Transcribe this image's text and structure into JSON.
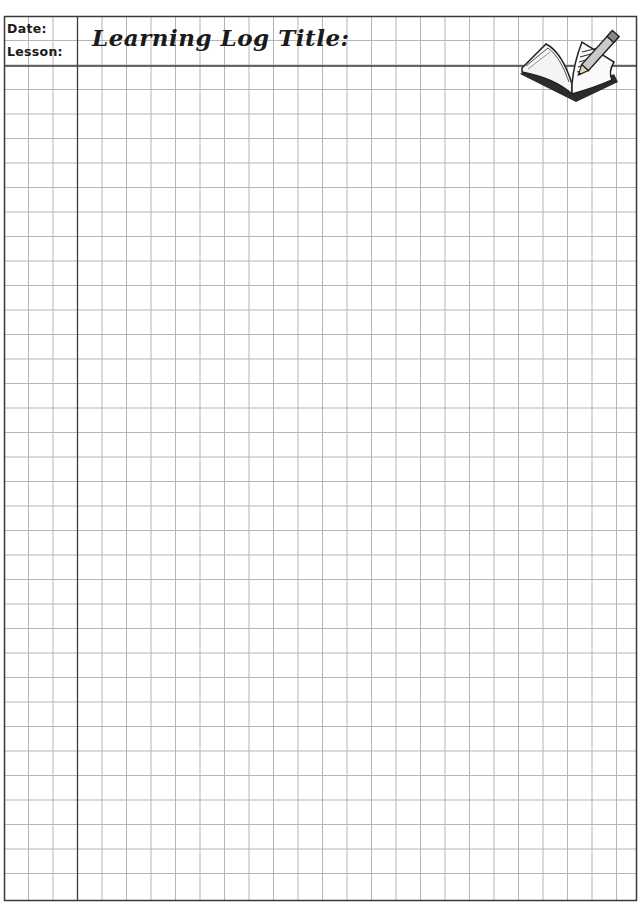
{
  "header": {
    "date_label": "Date:",
    "lesson_label": "Lesson:",
    "title_label": "Learning Log Title:"
  },
  "icon": "open-book-with-pencil-icon",
  "grid": {
    "cell_size_px": 24.5,
    "line_color": "#b0b0b0",
    "border_color": "#3a3a3a"
  }
}
